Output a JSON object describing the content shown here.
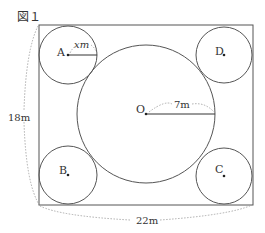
{
  "figure": {
    "title": "図１",
    "labels": {
      "A": "A",
      "B": "B",
      "C": "C",
      "D": "D",
      "O": "O",
      "small_radius": "xm",
      "big_radius": "7m",
      "height": "18m",
      "width": "22m"
    },
    "colors": {
      "stroke": "#555555",
      "dotted": "#999999",
      "text": "#333333"
    }
  }
}
